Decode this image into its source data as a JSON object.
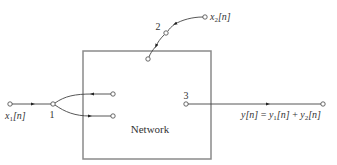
{
  "diagram": {
    "block": {
      "label": "Network"
    },
    "inputs": {
      "x1": {
        "base": "x",
        "sub": "1",
        "arg": "[n]"
      },
      "x2": {
        "base": "x",
        "sub": "2",
        "arg": "[n]"
      }
    },
    "nodes": {
      "n1": "1",
      "n2": "2",
      "n3": "3"
    },
    "output": {
      "lhs": "y[n]",
      "eq": " = ",
      "t1_base": "y",
      "t1_sub": "1",
      "t1_arg": "[n]",
      "plus": " + ",
      "t2_base": "y",
      "t2_sub": "2",
      "t2_arg": "[n]"
    }
  },
  "colors": {
    "line": "#555555",
    "box": "#888888",
    "text": "#333333"
  }
}
